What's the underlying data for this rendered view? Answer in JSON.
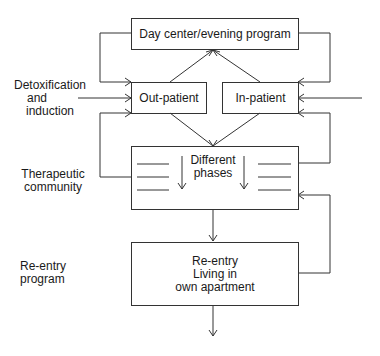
{
  "diagram": {
    "nodes": {
      "day_center": {
        "label": "Day center/evening program"
      },
      "out_patient": {
        "label": "Out-patient"
      },
      "in_patient": {
        "label": "In-patient"
      },
      "therapeutic": {
        "label_line1": "Different",
        "label_line2": "phases"
      },
      "reentry": {
        "line1": "Re-entry",
        "line2": "Living in",
        "line3": "own apartment"
      }
    },
    "side_labels": {
      "detox": {
        "line1": "Detoxification",
        "line2": "and",
        "line3": "induction"
      },
      "therapeutic_community": {
        "line1": "Therapeutic",
        "line2": "community"
      },
      "reentry_program": {
        "line1": "Re-entry",
        "line2": "program"
      }
    },
    "colors": {
      "line": "#333333",
      "text": "#1a1a1a",
      "background": "#ffffff"
    }
  }
}
